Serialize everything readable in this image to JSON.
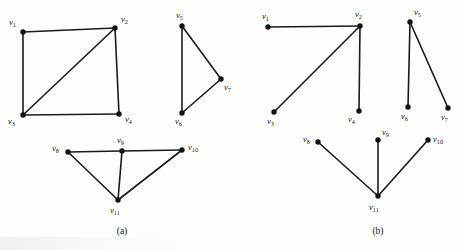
{
  "figure": {
    "background_color": "#fdfdfc",
    "ink_color": "#121212",
    "panels": [
      {
        "id": "panel-a",
        "caption": "(a)",
        "caption_x": 122,
        "caption_y": 234,
        "components": [
          {
            "id": "a-component-1",
            "name": "square-with-diagonal",
            "vertices": [
              {
                "id": "v1",
                "label": "v",
                "sub": "1",
                "x": 23,
                "y": 32,
                "label_x": 9,
                "label_y": 25
              },
              {
                "id": "v2",
                "label": "v",
                "sub": "2",
                "x": 115,
                "y": 28,
                "label_x": 121,
                "label_y": 22
              },
              {
                "id": "v3",
                "label": "v",
                "sub": "3",
                "x": 23,
                "y": 115,
                "label_x": 8,
                "label_y": 124
              },
              {
                "id": "v4",
                "label": "v",
                "sub": "4",
                "x": 119,
                "y": 114,
                "label_x": 125,
                "label_y": 122
              }
            ],
            "edges": [
              {
                "from": "v1",
                "to": "v2"
              },
              {
                "from": "v1",
                "to": "v3"
              },
              {
                "from": "v2",
                "to": "v4"
              },
              {
                "from": "v3",
                "to": "v4"
              },
              {
                "from": "v2",
                "to": "v3"
              }
            ]
          },
          {
            "id": "a-component-2",
            "name": "triangle",
            "vertices": [
              {
                "id": "v5",
                "label": "v",
                "sub": "5",
                "x": 182,
                "y": 26,
                "label_x": 176,
                "label_y": 18
              },
              {
                "id": "v6",
                "label": "v",
                "sub": "6",
                "x": 182,
                "y": 113,
                "label_x": 175,
                "label_y": 124
              },
              {
                "id": "v7",
                "label": "v",
                "sub": "7",
                "x": 221,
                "y": 79,
                "label_x": 224,
                "label_y": 90
              }
            ],
            "edges": [
              {
                "from": "v5",
                "to": "v6"
              },
              {
                "from": "v5",
                "to": "v7"
              },
              {
                "from": "v6",
                "to": "v7"
              }
            ]
          },
          {
            "id": "a-component-3",
            "name": "fan-with-cycles",
            "vertices": [
              {
                "id": "v8",
                "label": "v",
                "sub": "8",
                "x": 68,
                "y": 152,
                "label_x": 52,
                "label_y": 151
              },
              {
                "id": "v9",
                "label": "v",
                "sub": "9",
                "x": 122,
                "y": 151,
                "label_x": 117,
                "label_y": 143
              },
              {
                "id": "v10",
                "label": "v",
                "sub": "10",
                "x": 182,
                "y": 150,
                "label_x": 188,
                "label_y": 150
              },
              {
                "id": "v11",
                "label": "v",
                "sub": "11",
                "x": 118,
                "y": 200,
                "label_x": 110,
                "label_y": 213
              }
            ],
            "edges": [
              {
                "from": "v8",
                "to": "v9"
              },
              {
                "from": "v9",
                "to": "v10"
              },
              {
                "from": "v8",
                "to": "v11"
              },
              {
                "from": "v9",
                "to": "v11"
              },
              {
                "from": "v10",
                "to": "v11"
              }
            ]
          }
        ]
      },
      {
        "id": "panel-b",
        "caption": "(b)",
        "caption_x": 378,
        "caption_y": 234,
        "components": [
          {
            "id": "b-component-1",
            "name": "star-at-v2",
            "vertices": [
              {
                "id": "v1",
                "label": "v",
                "sub": "1",
                "x": 268,
                "y": 27,
                "label_x": 262,
                "label_y": 19
              },
              {
                "id": "v2",
                "label": "v",
                "sub": "2",
                "x": 360,
                "y": 26,
                "label_x": 355,
                "label_y": 17
              },
              {
                "id": "v3",
                "label": "v",
                "sub": "3",
                "x": 274,
                "y": 112,
                "label_x": 267,
                "label_y": 124
              },
              {
                "id": "v4",
                "label": "v",
                "sub": "4",
                "x": 359,
                "y": 111,
                "label_x": 348,
                "label_y": 122
              }
            ],
            "edges": [
              {
                "from": "v1",
                "to": "v2"
              },
              {
                "from": "v2",
                "to": "v3"
              },
              {
                "from": "v2",
                "to": "v4"
              }
            ]
          },
          {
            "id": "b-component-2",
            "name": "star-at-v5",
            "vertices": [
              {
                "id": "v5",
                "label": "v",
                "sub": "5",
                "x": 410,
                "y": 22,
                "label_x": 414,
                "label_y": 15
              },
              {
                "id": "v6",
                "label": "v",
                "sub": "6",
                "x": 408,
                "y": 107,
                "label_x": 401,
                "label_y": 119
              },
              {
                "id": "v7",
                "label": "v",
                "sub": "7",
                "x": 448,
                "y": 108,
                "label_x": 441,
                "label_y": 120
              }
            ],
            "edges": [
              {
                "from": "v5",
                "to": "v6"
              },
              {
                "from": "v5",
                "to": "v7"
              }
            ]
          },
          {
            "id": "b-component-3",
            "name": "star-at-v11",
            "vertices": [
              {
                "id": "v8",
                "label": "v",
                "sub": "8",
                "x": 318,
                "y": 142,
                "label_x": 303,
                "label_y": 142
              },
              {
                "id": "v9",
                "label": "v",
                "sub": "9",
                "x": 378,
                "y": 140,
                "label_x": 382,
                "label_y": 135
              },
              {
                "id": "v10",
                "label": "v",
                "sub": "10",
                "x": 428,
                "y": 140,
                "label_x": 433,
                "label_y": 142
              },
              {
                "id": "v11",
                "label": "v",
                "sub": "11",
                "x": 378,
                "y": 196,
                "label_x": 369,
                "label_y": 210
              }
            ],
            "edges": [
              {
                "from": "v8",
                "to": "v11"
              },
              {
                "from": "v9",
                "to": "v11"
              },
              {
                "from": "v10",
                "to": "v11"
              }
            ]
          }
        ]
      }
    ]
  }
}
